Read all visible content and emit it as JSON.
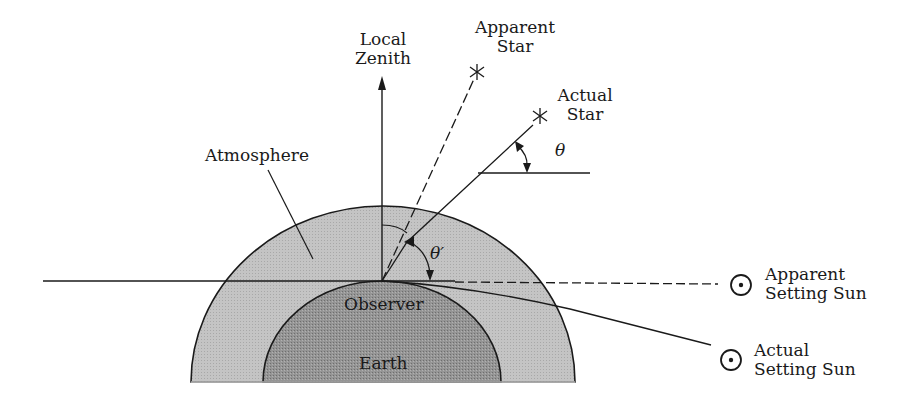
{
  "diagram": {
    "colors": {
      "atmosphere": "#bdbdbd",
      "earth": "#8f8f8f",
      "line": "#1a1a1a",
      "background": "#ffffff"
    },
    "labels": {
      "zenith_line1": "Local",
      "zenith_line2": "Zenith",
      "apparent_star_line1": "Apparent",
      "apparent_star_line2": "Star",
      "actual_star_line1": "Actual",
      "actual_star_line2": "Star",
      "theta": "θ",
      "theta_prime": "θ′",
      "atmosphere": "Atmosphere",
      "observer": "Observer",
      "earth": "Earth",
      "apparent_sun_line1": "Apparent",
      "apparent_sun_line2": "Setting Sun",
      "actual_sun_line1": "Actual",
      "actual_sun_line2": "Setting Sun"
    },
    "symbols": {
      "star": "asterisk-star-icon",
      "sun": "circled-dot-sun-icon"
    }
  }
}
